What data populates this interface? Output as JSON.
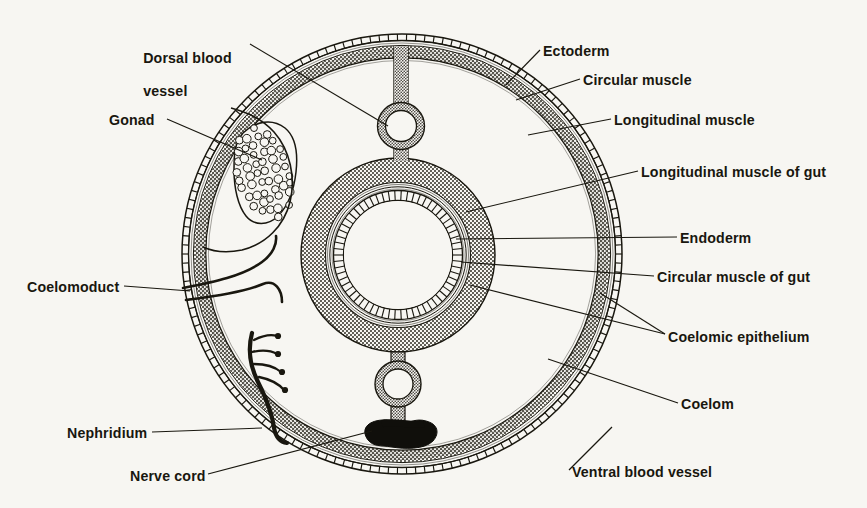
{
  "figure": {
    "background_color": "#f7f6f2",
    "ink_color": "#19170f",
    "type": "anatomical-cross-section",
    "view": "transverse section, dorsal at top, ventral at bottom"
  },
  "labels_left": [
    {
      "name": "dorsal-blood-vessel",
      "text": "Dorsal blood\nvessel",
      "line1": "Dorsal blood",
      "line2": "vessel",
      "x": 135,
      "y": 33
    },
    {
      "name": "gonad",
      "text": "Gonad",
      "x": 109,
      "y": 112
    },
    {
      "name": "coelomoduct",
      "text": "Coelomoduct",
      "x": 27,
      "y": 279
    },
    {
      "name": "nephridium",
      "text": "Nephridium",
      "x": 67,
      "y": 425
    },
    {
      "name": "nerve-cord",
      "text": "Nerve cord",
      "x": 130,
      "y": 468
    }
  ],
  "labels_right": [
    {
      "name": "ectoderm",
      "text": "Ectoderm",
      "x": 543,
      "y": 43
    },
    {
      "name": "circular-muscle",
      "text": "Circular muscle",
      "x": 583,
      "y": 72
    },
    {
      "name": "longitudinal-muscle",
      "text": "Longitudinal muscle",
      "x": 614,
      "y": 112
    },
    {
      "name": "longitudinal-muscle-of-gut",
      "text": "Longitudinal muscle of gut",
      "x": 641,
      "y": 164
    },
    {
      "name": "endoderm",
      "text": "Endoderm",
      "x": 680,
      "y": 230
    },
    {
      "name": "circular-muscle-of-gut",
      "text": "Circular muscle of gut",
      "x": 657,
      "y": 269
    },
    {
      "name": "coelomic-epithelium",
      "text": "Coelomic epithelium",
      "x": 668,
      "y": 329
    },
    {
      "name": "coelom",
      "text": "Coelom",
      "x": 681,
      "y": 396
    },
    {
      "name": "ventral-blood-vessel",
      "text": "Ventral blood vessel",
      "x": 572,
      "y": 464
    }
  ],
  "structures": [
    {
      "name": "ectoderm",
      "description": "outermost crenellated epithelial ring of body wall"
    },
    {
      "name": "circular-muscle",
      "description": "thin pale band inside ectoderm"
    },
    {
      "name": "longitudinal-muscle",
      "description": "thick stippled layer of body wall"
    },
    {
      "name": "coelomic-epithelium",
      "description": "thin lining bounding the coelom"
    },
    {
      "name": "coelom",
      "description": "large unshaded body cavity between body wall and gut"
    },
    {
      "name": "gut",
      "description": "central ring: longitudinal muscle, circular muscle, endoderm, lumen"
    },
    {
      "name": "dorsal-blood-vessel",
      "description": "small ring in dorsal mesentery above gut"
    },
    {
      "name": "ventral-blood-vessel",
      "description": "small ring in ventral mesentery below gut"
    },
    {
      "name": "nerve-cord",
      "description": "solid black ventral mass"
    },
    {
      "name": "gonad",
      "description": "mass of germ cells bulging into coelom from dorso-lateral body wall"
    },
    {
      "name": "coelomoduct",
      "description": "ciliated funnel tube opening through body wall"
    },
    {
      "name": "nephridium",
      "description": "dark branching tubule with solenocyte tufts"
    }
  ]
}
